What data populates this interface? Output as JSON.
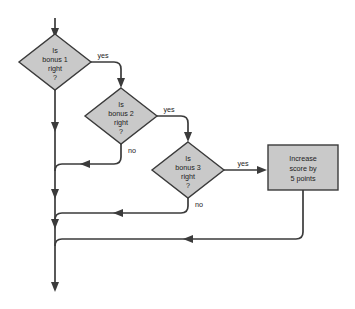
{
  "diagram": {
    "type": "flowchart",
    "colors": {
      "shape_fill": "#c9c9c9",
      "shape_stroke": "#3b3b3b",
      "line": "#3b3b3b",
      "text": "#1c1c1c",
      "background": "#ffffff"
    },
    "nodes": [
      {
        "id": "decision-bonus-1",
        "shape": "diamond",
        "lines": [
          "Is",
          "bonus 1",
          "right",
          "?"
        ]
      },
      {
        "id": "decision-bonus-2",
        "shape": "diamond",
        "lines": [
          "Is",
          "bonus 2",
          "right",
          "?"
        ]
      },
      {
        "id": "decision-bonus-3",
        "shape": "diamond",
        "lines": [
          "Is",
          "bonus 3",
          "right",
          "?"
        ]
      },
      {
        "id": "process-increase-score",
        "shape": "rectangle",
        "lines": [
          "Increase",
          "score by",
          "5 points"
        ]
      }
    ],
    "edge_labels": {
      "yes_1": "yes",
      "yes_2": "yes",
      "yes_3": "yes",
      "no_2": "no",
      "no_3": "no"
    }
  }
}
